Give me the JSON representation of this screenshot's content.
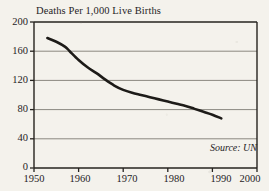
{
  "chart_data": {
    "type": "line",
    "title": "Deaths Per 1,000 Live Births",
    "xlabel": "",
    "ylabel": "",
    "xlim": [
      1950,
      2000
    ],
    "ylim": [
      0,
      200
    ],
    "grid": true,
    "legend": false,
    "annotation": "Source: UN",
    "x_ticks": [
      "1950",
      "1960",
      "1970",
      "1980",
      "1990",
      "2000"
    ],
    "y_ticks": [
      "0",
      "40",
      "80",
      "120",
      "160",
      "200"
    ],
    "series": [
      {
        "name": "Deaths Per 1,000 Live Births",
        "color": "#1d1b18",
        "x": [
          1953,
          1955,
          1957,
          1958,
          1960,
          1962,
          1964,
          1966,
          1968,
          1970,
          1972,
          1974,
          1976,
          1978,
          1980,
          1982,
          1984,
          1986,
          1988,
          1990,
          1992
        ],
        "values": [
          178,
          173,
          166,
          160,
          148,
          138,
          130,
          121,
          113,
          107,
          103,
          100,
          97,
          94,
          91,
          88,
          85,
          81,
          77,
          73,
          68
        ]
      }
    ]
  },
  "axes": {
    "y_tick_values": [
      200,
      160,
      120,
      80,
      40,
      0
    ],
    "x_tick_values": [
      1950,
      1960,
      1970,
      1980,
      1990,
      2000
    ]
  },
  "colors": {
    "background": "#f4f2ec",
    "axis": "#26231f",
    "grid": "#8b8880",
    "line": "#1d1b18",
    "text": "#26231f"
  }
}
